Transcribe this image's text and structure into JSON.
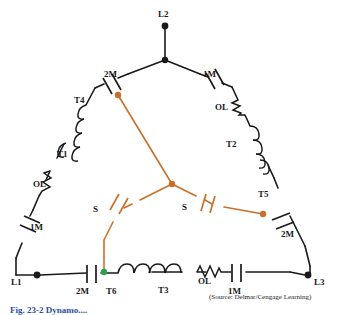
{
  "figure": {
    "caption": "Fig. 23-2  Dynamo....",
    "source_note": "(Source: Delmar/Cengage Learning)",
    "colors": {
      "wire_black": "#1a1a1a",
      "wire_orange": "#c8702a",
      "node_green": "#2e9e4f",
      "caption_blue": "#2b4ea2",
      "background": "#ffffff"
    }
  },
  "terminals": [
    {
      "id": "L1",
      "label": "L1",
      "x": 14,
      "y": 281
    },
    {
      "id": "L2",
      "label": "L2",
      "x": 158,
      "y": 12
    },
    {
      "id": "L3",
      "label": "L3",
      "x": 312,
      "y": 281
    }
  ],
  "contacts": [
    {
      "id": "c-2m-top-left",
      "label": "2M",
      "x": 110,
      "y": 78
    },
    {
      "id": "c-1m-top-right",
      "label": "1M",
      "x": 200,
      "y": 78
    },
    {
      "id": "c-1m-left",
      "label": "1M",
      "x": 42,
      "y": 230
    },
    {
      "id": "c-2m-bottom-left",
      "label": "2M",
      "x": 92,
      "y": 285
    },
    {
      "id": "c-1m-bottom-right",
      "label": "1M",
      "x": 234,
      "y": 285
    },
    {
      "id": "c-2m-right",
      "label": "2M",
      "x": 283,
      "y": 230
    },
    {
      "id": "c-s-left",
      "label": "S",
      "x": 95,
      "y": 211
    },
    {
      "id": "c-s-right",
      "label": "S",
      "x": 183,
      "y": 211
    }
  ],
  "overloads": [
    {
      "id": "ol-left",
      "label": "OL",
      "x": 41,
      "y": 186
    },
    {
      "id": "ol-right",
      "label": "OL",
      "x": 219,
      "y": 110
    },
    {
      "id": "ol-bottom",
      "label": "OL",
      "x": 204,
      "y": 277
    }
  ],
  "windings": [
    {
      "id": "T1",
      "label": "T1",
      "x": 62,
      "y": 155
    },
    {
      "id": "T2",
      "label": "T2",
      "x": 229,
      "y": 145
    },
    {
      "id": "T3",
      "label": "T3",
      "x": 164,
      "y": 291
    },
    {
      "id": "T4",
      "label": "T4",
      "x": 80,
      "y": 101
    },
    {
      "id": "T5",
      "label": "T5",
      "x": 262,
      "y": 196
    },
    {
      "id": "T6",
      "label": "T6",
      "x": 111,
      "y": 288
    }
  ],
  "nodes": [
    {
      "id": "node-center",
      "x": 172,
      "y": 184,
      "color": "#c8702a"
    },
    {
      "id": "node-t4",
      "x": 118,
      "y": 95,
      "color": "#c8702a"
    },
    {
      "id": "node-t5",
      "x": 263,
      "y": 214,
      "color": "#c8702a"
    },
    {
      "id": "node-t6",
      "x": 104,
      "y": 272,
      "color": "#2e9e4f"
    }
  ]
}
